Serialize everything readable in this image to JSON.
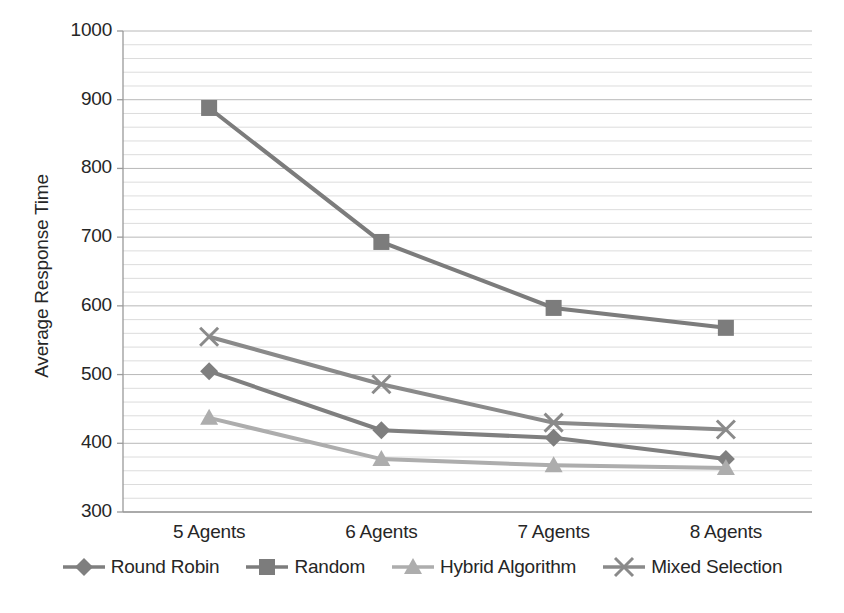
{
  "chart_data": {
    "type": "line",
    "title": "",
    "xlabel": "",
    "ylabel": "Average Response Time",
    "categories": [
      "5 Agents",
      "6 Agents",
      "7 Agents",
      "8 Agents"
    ],
    "ylim": [
      300,
      1000
    ],
    "ytick_labels": [
      "300",
      "400",
      "500",
      "600",
      "700",
      "800",
      "900",
      "1000"
    ],
    "ytick_values": [
      300,
      400,
      500,
      600,
      700,
      800,
      900,
      1000
    ],
    "grid": true,
    "minor_grid": true,
    "minor_grid_step": 20,
    "legend_position": "bottom",
    "series": [
      {
        "name": "Round Robin",
        "marker": "diamond",
        "color": "#7F7F7F",
        "values": [
          505,
          419,
          408,
          377
        ]
      },
      {
        "name": "Random",
        "marker": "square",
        "color": "#7C7C7C",
        "values": [
          888,
          693,
          597,
          568
        ]
      },
      {
        "name": "Hybrid Algorithm",
        "marker": "triangle",
        "color": "#ADADAD",
        "values": [
          437,
          377,
          368,
          364
        ]
      },
      {
        "name": "Mixed Selection",
        "marker": "x",
        "color": "#8A8A8A",
        "values": [
          555,
          486,
          430,
          420
        ]
      }
    ]
  },
  "colors": {
    "axis": "#9A9A9A",
    "major_grid": "#B8B8B8",
    "minor_grid": "#D8D8D8",
    "text": "#262626",
    "background": "#FFFFFF"
  }
}
